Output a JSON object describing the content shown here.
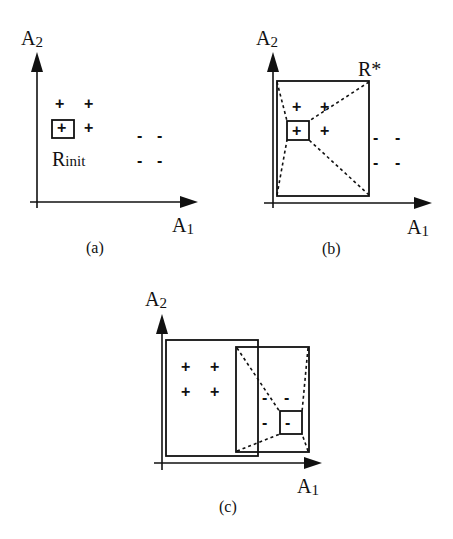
{
  "panels": {
    "a": {
      "caption": "(a)",
      "y_axis_label": "A",
      "y_axis_sub": "2",
      "x_axis_label": "A",
      "x_axis_sub": "1",
      "region_label": "R",
      "region_sub": "init",
      "positive_symbol": "+",
      "negative_symbol": "-"
    },
    "b": {
      "caption": "(b)",
      "y_axis_label": "A",
      "y_axis_sub": "2",
      "x_axis_label": "A",
      "x_axis_sub": "1",
      "region_label": "R*",
      "positive_symbol": "+",
      "negative_symbol": "-"
    },
    "c": {
      "caption": "(c)",
      "y_axis_label": "A",
      "y_axis_sub": "2",
      "x_axis_label": "A",
      "x_axis_sub": "1",
      "positive_symbol": "+",
      "negative_symbol": "-"
    }
  },
  "colors": {
    "ink": "#111111",
    "background": "#ffffff"
  }
}
